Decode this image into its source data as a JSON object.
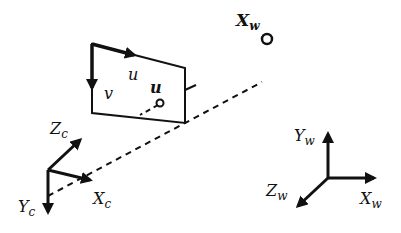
{
  "diagram": {
    "type": "pinhole camera projection",
    "world_point": {
      "label": "X",
      "subscript": "w"
    },
    "image_point": {
      "label": "u"
    },
    "image_plane": {
      "u_axis_label": "u",
      "v_axis_label": "v"
    },
    "camera_frame": {
      "x_label": "X",
      "x_sub": "c",
      "y_label": "Y",
      "y_sub": "c",
      "z_label": "Z",
      "z_sub": "c"
    },
    "world_frame": {
      "x_label": "X",
      "x_sub": "w",
      "y_label": "Y",
      "y_sub": "w",
      "z_label": "Z",
      "z_sub": "w"
    },
    "colors": {
      "ink": "#111111",
      "background": "#ffffff"
    }
  }
}
